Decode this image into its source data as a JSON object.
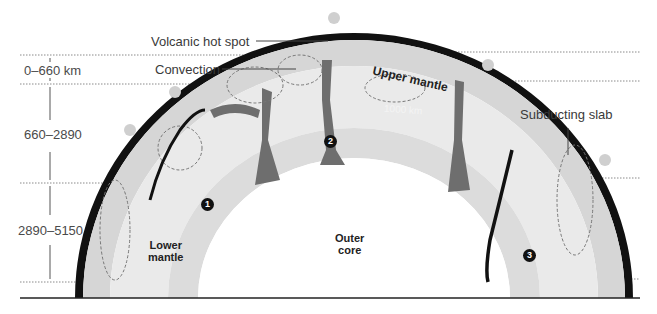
{
  "diagram": {
    "depth_ranges": [
      {
        "label": "0–660 km"
      },
      {
        "label": "660–2890"
      },
      {
        "label": "2890–5150"
      }
    ],
    "callouts": {
      "hotspot": "Volcanic hot spot",
      "convection": "Convection",
      "slab": "Subducting slab"
    },
    "layers": {
      "upper_mantle": "Upper mantle",
      "lower_mantle_1": "Lower",
      "lower_mantle_2": "mantle",
      "outer_core_1": "Outer",
      "outer_core_2": "core",
      "depth_marker": "1000 km"
    },
    "markers": [
      "1",
      "2",
      "3"
    ],
    "colors": {
      "crust": "#111111",
      "upper_mantle": "#d4d4d4",
      "lower_mantle": "#e8e8e8",
      "plume": "#6e6e6e",
      "core": "#ffffff",
      "dotted_line": "#8a8a8a"
    }
  }
}
